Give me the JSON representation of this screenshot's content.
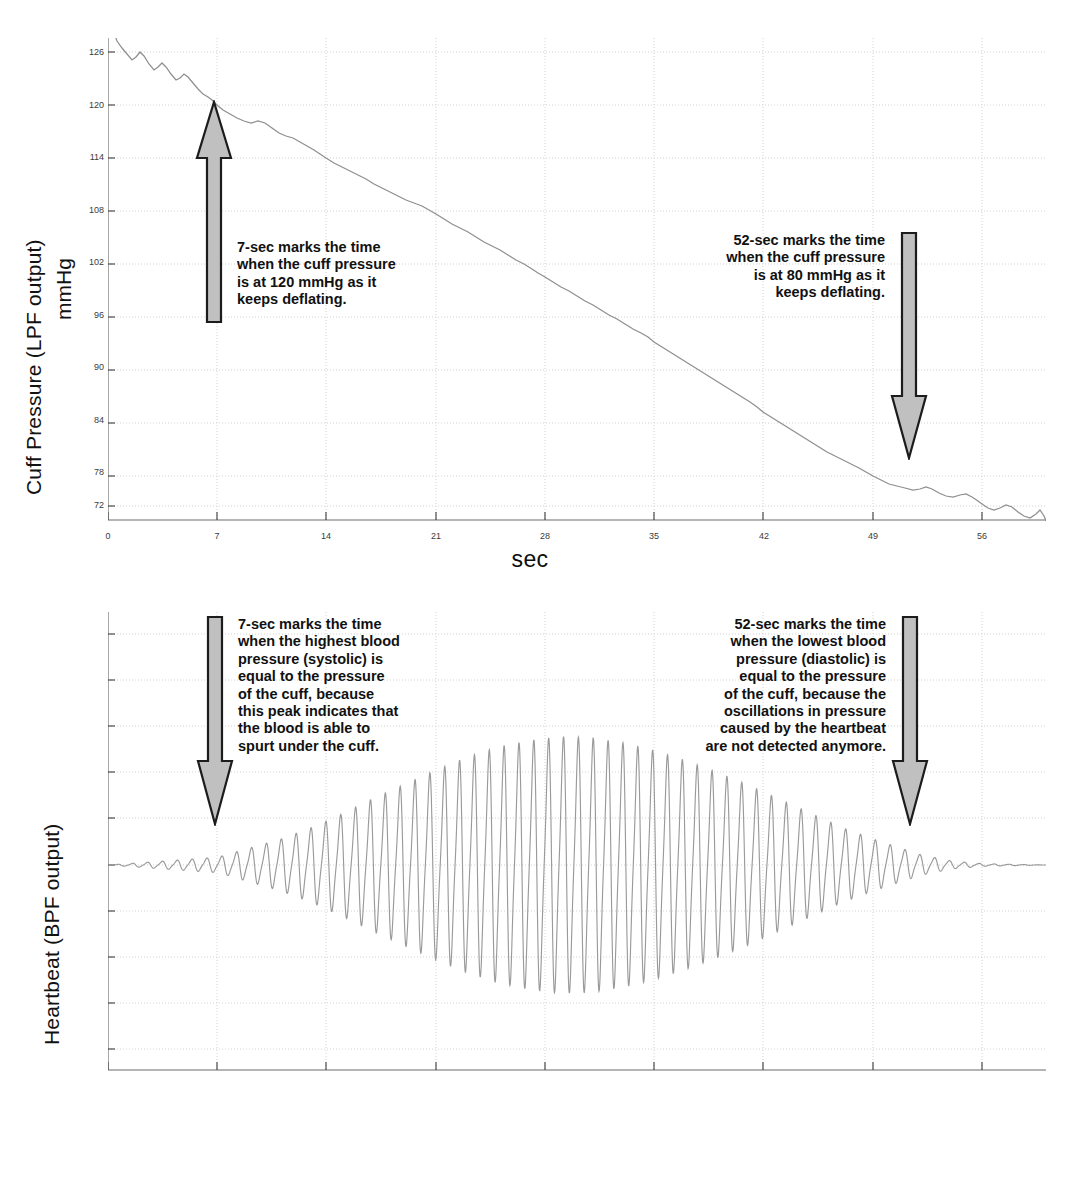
{
  "figure_top": {
    "y_axis_title_line1": "Cuff Pressure (LPF output)",
    "y_axis_title_line2": "mmHg",
    "x_axis_title": "sec",
    "annotation_left": "7-sec marks the time\nwhen the cuff pressure\nis at 120 mmHg as it\nkeeps deflating.",
    "annotation_right": "52-sec marks the time\nwhen the cuff pressure\nis at 80 mmHg as it\nkeeps deflating."
  },
  "figure_bottom": {
    "y_axis_title": "Heartbeat (BPF output)",
    "x_axis_title": "sec",
    "annotation_left": "7-sec marks the time\nwhen the highest blood\npressure (systolic) is\nequal to the pressure\nof the cuff, because\nthis peak indicates that\nthe blood is able to\nspurt under the cuff.",
    "annotation_right": "52-sec marks the time\nwhen the lowest blood\npressure (diastolic) is\nequal to the pressure\nof the cuff, because the\noscillations in pressure\ncaused by the heartbeat\nare not detected anymore."
  },
  "chart_data": [
    {
      "id": "cuff-pressure",
      "type": "line",
      "title": "",
      "xlabel": "sec",
      "ylabel": "Cuff Pressure (LPF output) mmHg",
      "xlim": [
        0,
        60
      ],
      "ylim": [
        69,
        129
      ],
      "xticks": [
        0,
        7,
        14,
        21,
        28,
        35,
        42,
        49,
        56
      ],
      "yticks": [
        72,
        78,
        84,
        90,
        96,
        102,
        108,
        114,
        120,
        126
      ],
      "grid": true,
      "legend": "none",
      "series": [
        {
          "name": "Cuff pressure (LPF output)",
          "color": "#8a8a8a",
          "x": [
            0.0,
            0.5,
            1.0,
            1.5,
            2.0,
            2.5,
            3.0,
            3.5,
            4.0,
            4.5,
            5.0,
            5.5,
            6.0,
            6.5,
            7.0,
            8.0,
            9.0,
            10.0,
            11.0,
            12.0,
            13.0,
            14.0,
            15.0,
            16.0,
            17.0,
            18.0,
            19.0,
            20.0,
            21.0,
            22.0,
            23.0,
            24.0,
            25.0,
            26.0,
            27.0,
            28.0,
            29.0,
            30.0,
            31.0,
            32.0,
            33.0,
            34.0,
            35.0,
            36.0,
            37.0,
            38.0,
            39.0,
            40.0,
            41.0,
            42.0,
            43.0,
            44.0,
            45.0,
            46.0,
            47.0,
            48.0,
            49.0,
            50.0,
            51.0,
            52.0,
            53.0,
            54.0,
            55.0,
            56.0,
            57.0,
            58.0,
            59.0,
            59.5
          ],
          "y": [
            129.0,
            127.6,
            126.3,
            124.8,
            124.5,
            125.2,
            124.1,
            123.0,
            123.3,
            122.4,
            121.2,
            121.5,
            120.8,
            120.3,
            120.0,
            119.0,
            118.2,
            117.6,
            117.7,
            117.0,
            116.2,
            115.4,
            114.8,
            114.0,
            113.4,
            112.5,
            111.7,
            111.0,
            110.3,
            109.6,
            108.9,
            108.2,
            107.4,
            106.5,
            105.6,
            104.8,
            104.0,
            103.2,
            102.3,
            101.5,
            100.6,
            99.7,
            98.8,
            97.9,
            97.0,
            96.0,
            95.0,
            94.1,
            93.1,
            92.1,
            91.0,
            89.9,
            88.8,
            87.6,
            86.4,
            85.2,
            84.0,
            82.8,
            81.6,
            80.4,
            79.6,
            79.2,
            78.3,
            76.9,
            76.0,
            75.6,
            73.8,
            71.2
          ]
        }
      ],
      "annotations": [
        {
          "label": "7-sec marks the time when the cuff pressure is at 120 mmHg as it keeps deflating.",
          "x": 7,
          "y": 120,
          "arrow": "up"
        },
        {
          "label": "52-sec marks the time when the cuff pressure is at 80 mmHg as it keeps deflating.",
          "x": 52,
          "y": 80,
          "arrow": "down"
        }
      ]
    },
    {
      "id": "heartbeat",
      "type": "line",
      "title": "",
      "xlabel": "sec",
      "ylabel": "Heartbeat (BPF output)",
      "xlim": [
        0,
        60
      ],
      "ylim": [
        -1.15,
        1.0
      ],
      "xticks": [
        0,
        7,
        14,
        21,
        28,
        35,
        42,
        49,
        56
      ],
      "yticks": [],
      "grid": true,
      "legend": "none",
      "series": [
        {
          "name": "Heartbeat oscillation (BPF output)",
          "color": "#8a8a8a",
          "description": "Oscillometric pulse train; baseline flat before 7 s, amplitude envelope rises from 7 s, peaks near 28-30 s, decays to flat after ~52 s",
          "baseline": 0,
          "pulse_period_sec": 0.95,
          "envelope_x": [
            0,
            7,
            9,
            11,
            13,
            15,
            17,
            19,
            21,
            23,
            25,
            27,
            29,
            31,
            33,
            35,
            37,
            39,
            41,
            43,
            45,
            47,
            49,
            51,
            52,
            54,
            56,
            60
          ],
          "envelope_amp": [
            0.0,
            0.06,
            0.13,
            0.2,
            0.29,
            0.4,
            0.52,
            0.63,
            0.74,
            0.84,
            0.92,
            0.97,
            1.0,
            0.99,
            0.95,
            0.89,
            0.81,
            0.72,
            0.62,
            0.51,
            0.4,
            0.29,
            0.2,
            0.12,
            0.08,
            0.03,
            0.01,
            0.0
          ]
        }
      ],
      "annotations": [
        {
          "label": "7-sec marks the time when the highest blood pressure (systolic) is equal to the pressure of the cuff, because this peak indicates that the blood is able to spurt under the cuff.",
          "x": 7,
          "arrow": "down"
        },
        {
          "label": "52-sec marks the time when the lowest blood pressure (diastolic) is equal to the pressure of the cuff, because the oscillations in pressure caused by the heartbeat are not detected anymore.",
          "x": 52,
          "arrow": "down"
        }
      ]
    }
  ],
  "colors": {
    "trace": "#8a8a8a",
    "grid": "#cfcfcf",
    "axis": "#6d6d6d",
    "arrow_fill": "#bfbfbf",
    "arrow_stroke": "#1a1a1a",
    "text": "#111111"
  }
}
